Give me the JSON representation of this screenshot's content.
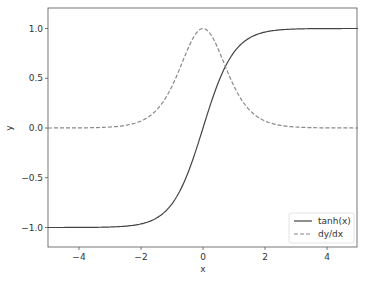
{
  "chart_data": {
    "type": "line",
    "title": "",
    "xlabel": "x",
    "ylabel": "y",
    "xlim": [
      -5,
      5
    ],
    "ylim": [
      -1.2,
      1.2
    ],
    "grid": false,
    "legend_position": "lower right",
    "xticks": [
      -4,
      -2,
      0,
      2,
      4
    ],
    "xtick_labels": [
      "−4",
      "−2",
      "0",
      "2",
      "4"
    ],
    "yticks": [
      -1.0,
      -0.5,
      0.0,
      0.5,
      1.0
    ],
    "ytick_labels": [
      "−1.0",
      "−0.5",
      "0.0",
      "0.5",
      "1.0"
    ],
    "series": [
      {
        "name": "tanh(x)",
        "style": "solid",
        "color": "#444444",
        "x": [
          -5,
          -4,
          -3,
          -2,
          -1.5,
          -1,
          -0.5,
          0,
          0.5,
          1,
          1.5,
          2,
          3,
          4,
          5
        ],
        "values": [
          -1.0,
          -0.999,
          -0.995,
          -0.964,
          -0.905,
          -0.762,
          -0.462,
          0.0,
          0.462,
          0.762,
          0.905,
          0.964,
          0.995,
          0.999,
          1.0
        ]
      },
      {
        "name": "dy/dx",
        "style": "dashed",
        "color": "#888888",
        "x": [
          -5,
          -4,
          -3,
          -2,
          -1.5,
          -1,
          -0.5,
          0,
          0.5,
          1,
          1.5,
          2,
          3,
          4,
          5
        ],
        "values": [
          0.0,
          0.001,
          0.01,
          0.071,
          0.181,
          0.42,
          0.786,
          1.0,
          0.786,
          0.42,
          0.181,
          0.071,
          0.01,
          0.001,
          0.0
        ]
      }
    ]
  },
  "legend": {
    "items": [
      {
        "label": "tanh(x)"
      },
      {
        "label": "dy/dx"
      }
    ]
  },
  "axes": {
    "xlabel": "x",
    "ylabel": "y"
  }
}
